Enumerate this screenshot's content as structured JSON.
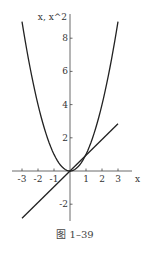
{
  "chart_data": {
    "type": "line",
    "title": "",
    "xlabel": "x",
    "ylabel": "x, x^2",
    "xlim": [
      -3,
      3
    ],
    "ylim": [
      -2.8,
      9
    ],
    "x_ticks": [
      -3,
      -2,
      -1,
      1,
      2,
      3
    ],
    "x_tick_labels": [
      "-3",
      "-2",
      "-1",
      "1",
      "2",
      "3"
    ],
    "y_ticks": [
      -2,
      2,
      4,
      6,
      8
    ],
    "y_tick_labels": [
      "-2",
      "2",
      "4",
      "6",
      "8"
    ],
    "grid": false,
    "legend": null,
    "series": [
      {
        "name": "x^2",
        "x": [
          -3,
          -2,
          -1,
          0,
          1,
          2,
          3
        ],
        "values": [
          9,
          4,
          1,
          0,
          1,
          4,
          9
        ],
        "color": "#222222"
      },
      {
        "name": "x",
        "x": [
          -3,
          3
        ],
        "values": [
          -3,
          3
        ],
        "color": "#222222"
      }
    ]
  },
  "caption": "图 1–39"
}
